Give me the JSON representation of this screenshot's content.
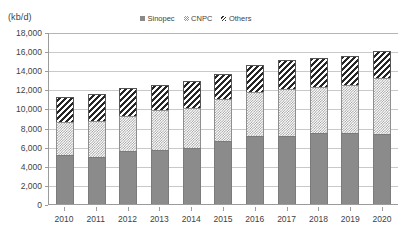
{
  "chart_data": {
    "type": "bar",
    "subtype": "stacked-column",
    "title": "",
    "xlabel": "",
    "ylabel": "(kb/d)",
    "ylim": [
      0,
      18000
    ],
    "ytick_step": 2000,
    "ytick_labels": [
      "18,000",
      "16,000",
      "14,000",
      "12,000",
      "10,000",
      "8,000",
      "6,000",
      "4,000",
      "2,000",
      "0"
    ],
    "ytick_values": [
      18000,
      16000,
      14000,
      12000,
      10000,
      8000,
      6000,
      4000,
      2000,
      0
    ],
    "grid": true,
    "legend_position": "top-center",
    "categories": [
      "2010",
      "2011",
      "2012",
      "2013",
      "2014",
      "2015",
      "2016",
      "2017",
      "2018",
      "2019",
      "2020"
    ],
    "series": [
      {
        "name": "Sinopec",
        "fill": "solid-gray",
        "color": "#8b8b8b",
        "values": [
          5100,
          4950,
          5500,
          5700,
          5900,
          6550,
          7150,
          7150,
          7400,
          7400,
          7350
        ]
      },
      {
        "name": "CNPC",
        "fill": "stippled",
        "color": "#9d9d9d",
        "values": [
          3450,
          3750,
          3750,
          4150,
          4100,
          4400,
          4550,
          4850,
          4850,
          5050,
          5800
        ]
      },
      {
        "name": "Others",
        "fill": "diagonal-hatch",
        "color": "#262626",
        "values": [
          2700,
          2800,
          2850,
          2650,
          2850,
          2700,
          2800,
          3050,
          3000,
          3000,
          2900
        ]
      }
    ],
    "totals": [
      11250,
      11500,
      12100,
      12500,
      12850,
      13650,
      14500,
      15050,
      15250,
      15450,
      16050
    ]
  },
  "legend": {
    "items": [
      {
        "label": "Sinopec"
      },
      {
        "label": "CNPC"
      },
      {
        "label": "Others"
      }
    ]
  },
  "axis": {
    "unit_label": "(kb/d)"
  }
}
